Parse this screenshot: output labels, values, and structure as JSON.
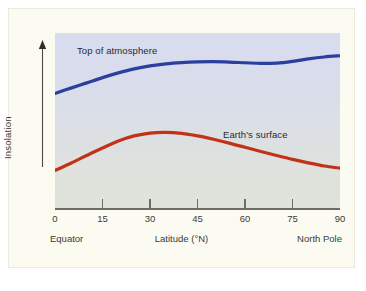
{
  "chart_data": {
    "type": "line",
    "title": "",
    "xlabel": "Latitude (°N)",
    "ylabel": "Insolation",
    "xlim": [
      0,
      90
    ],
    "ylim": [
      0,
      1
    ],
    "grid": false,
    "legend_position": "inline-annotations",
    "x_ticks": [
      "0",
      "15",
      "30",
      "45",
      "60",
      "75",
      "90"
    ],
    "x_tick_values": [
      0,
      15,
      30,
      45,
      60,
      75,
      90
    ],
    "y_ticks": [],
    "axis_captions": {
      "left": "Equator",
      "center": "Latitude (°N)",
      "right": "North Pole"
    },
    "series": [
      {
        "name": "Top of atmosphere",
        "color": "#2a3f9e",
        "x": [
          0,
          5,
          10,
          15,
          20,
          25,
          30,
          35,
          40,
          45,
          50,
          55,
          60,
          65,
          70,
          75,
          80,
          85,
          90
        ],
        "values": [
          0.655,
          0.685,
          0.715,
          0.745,
          0.772,
          0.795,
          0.812,
          0.824,
          0.831,
          0.835,
          0.836,
          0.834,
          0.83,
          0.826,
          0.828,
          0.838,
          0.852,
          0.863,
          0.87
        ]
      },
      {
        "name": "Earth's surface",
        "color": "#c23218",
        "x": [
          0,
          5,
          10,
          15,
          20,
          25,
          30,
          35,
          40,
          45,
          50,
          55,
          60,
          65,
          70,
          75,
          80,
          85,
          90
        ],
        "values": [
          0.215,
          0.256,
          0.3,
          0.343,
          0.383,
          0.412,
          0.428,
          0.432,
          0.426,
          0.412,
          0.393,
          0.371,
          0.347,
          0.323,
          0.3,
          0.278,
          0.258,
          0.24,
          0.228
        ]
      }
    ],
    "annotations": [
      {
        "text": "Top of atmosphere",
        "x": 7,
        "y": 0.92
      },
      {
        "text": "Earth's surface",
        "x": 54,
        "y": 0.46
      }
    ]
  },
  "colors": {
    "top_of_atmosphere": "#2a3f9e",
    "earths_surface": "#c23218",
    "card_background": "#fbfbf1",
    "plot_top": "#d7dcf0",
    "plot_bottom": "#e0e3d9",
    "axis": "#6d6d64"
  }
}
